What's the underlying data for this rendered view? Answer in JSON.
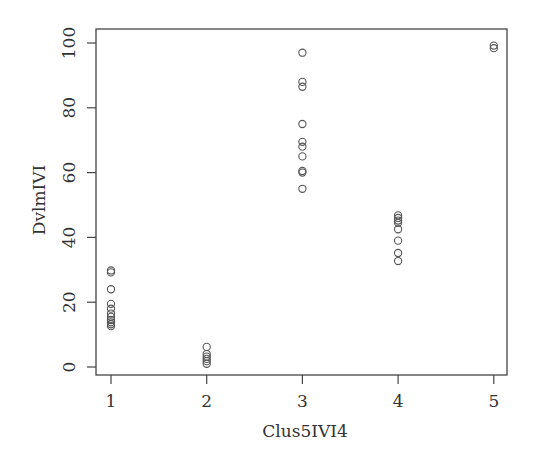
{
  "chart_data": {
    "type": "scatter",
    "title": "",
    "xlabel": "Clus5IVI4",
    "ylabel": "DvlmIVI",
    "xlim": [
      0.85,
      5.15
    ],
    "ylim": [
      -2.5,
      102
    ],
    "x_ticks": [
      1,
      2,
      3,
      4,
      5
    ],
    "y_ticks": [
      0,
      20,
      40,
      60,
      80,
      100
    ],
    "grid": false,
    "legend": null,
    "marker": "open-circle",
    "series": [
      {
        "name": "points",
        "points": [
          {
            "x": 1,
            "y": 29.8
          },
          {
            "x": 1,
            "y": 29.2
          },
          {
            "x": 1,
            "y": 24.0
          },
          {
            "x": 1,
            "y": 19.5
          },
          {
            "x": 1,
            "y": 18.0
          },
          {
            "x": 1,
            "y": 16.5
          },
          {
            "x": 1,
            "y": 15.5
          },
          {
            "x": 1,
            "y": 14.5
          },
          {
            "x": 1,
            "y": 13.8
          },
          {
            "x": 1,
            "y": 13.2
          },
          {
            "x": 1,
            "y": 12.6
          },
          {
            "x": 2,
            "y": 6.2
          },
          {
            "x": 2,
            "y": 4.0
          },
          {
            "x": 2,
            "y": 3.2
          },
          {
            "x": 2,
            "y": 2.5
          },
          {
            "x": 2,
            "y": 1.8
          },
          {
            "x": 2,
            "y": 1.0
          },
          {
            "x": 3,
            "y": 97.0
          },
          {
            "x": 3,
            "y": 88.0
          },
          {
            "x": 3,
            "y": 86.5
          },
          {
            "x": 3,
            "y": 75.0
          },
          {
            "x": 3,
            "y": 69.5
          },
          {
            "x": 3,
            "y": 68.0
          },
          {
            "x": 3,
            "y": 65.0
          },
          {
            "x": 3,
            "y": 60.5
          },
          {
            "x": 3,
            "y": 60.0
          },
          {
            "x": 3,
            "y": 55.0
          },
          {
            "x": 4,
            "y": 46.8
          },
          {
            "x": 4,
            "y": 46.0
          },
          {
            "x": 4,
            "y": 45.2
          },
          {
            "x": 4,
            "y": 44.5
          },
          {
            "x": 4,
            "y": 42.5
          },
          {
            "x": 4,
            "y": 39.0
          },
          {
            "x": 4,
            "y": 35.2
          },
          {
            "x": 4,
            "y": 32.7
          },
          {
            "x": 5,
            "y": 99.2
          },
          {
            "x": 5,
            "y": 98.4
          }
        ]
      }
    ]
  },
  "labels": {
    "x_axis": "Clus5IVI4",
    "y_axis": "DvlmIVI",
    "x_ticks": [
      "1",
      "2",
      "3",
      "4",
      "5"
    ],
    "y_ticks": [
      "0",
      "20",
      "40",
      "60",
      "80",
      "100"
    ]
  }
}
